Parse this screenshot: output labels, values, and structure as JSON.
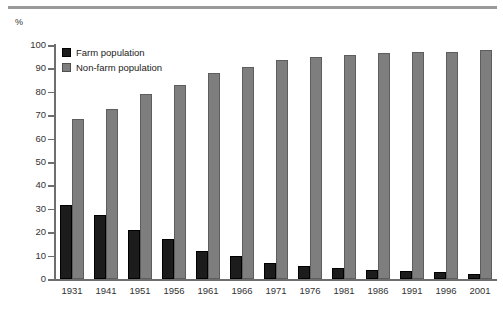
{
  "decorations": {
    "top_rule": "horizontal-rule"
  },
  "legend": {
    "items": [
      {
        "label": "Farm population",
        "color": "#1c1c1c",
        "key": "farm"
      },
      {
        "label": "Non-farm population",
        "color": "#7e7e7e",
        "key": "nonfarm"
      }
    ]
  },
  "axis": {
    "unit_label": "%",
    "y_ticks": [
      "100",
      "90",
      "80",
      "70",
      "60",
      "50",
      "40",
      "30",
      "20",
      "10",
      "0"
    ]
  },
  "chart_data": {
    "type": "bar",
    "title": "",
    "subtitle": "",
    "xlabel": "",
    "ylabel": "%",
    "ylim": [
      0,
      100
    ],
    "ytick_step": 10,
    "grid": false,
    "legend_position": "top-left-inside",
    "orientation": "vertical",
    "grouping": "grouped",
    "categories": [
      "1931",
      "1941",
      "1951",
      "1956",
      "1961",
      "1966",
      "1971",
      "1976",
      "1981",
      "1986",
      "1991",
      "1996",
      "2001"
    ],
    "series": [
      {
        "name": "Farm population",
        "color": "#1c1c1c",
        "values": [
          31.7,
          27.4,
          20.8,
          17.2,
          11.8,
          9.8,
          7.0,
          5.5,
          4.7,
          3.8,
          3.4,
          3.0,
          2.2
        ]
      },
      {
        "name": "Non-farm population",
        "color": "#7e7e7e",
        "values": [
          68.3,
          72.6,
          79.2,
          82.8,
          88.2,
          90.8,
          93.4,
          95.0,
          95.8,
          96.6,
          97.0,
          97.2,
          97.8
        ]
      }
    ]
  }
}
